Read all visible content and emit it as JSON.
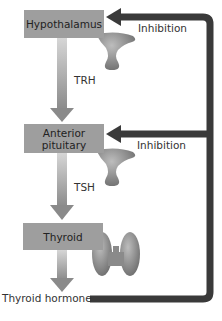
{
  "diagram": {
    "nodes": [
      {
        "id": "hypothalamus",
        "label": "Hypothalamus"
      },
      {
        "id": "anterior-pituitary",
        "label_line1": "Anterior",
        "label_line2": "pituitary"
      },
      {
        "id": "thyroid",
        "label": "Thyroid"
      }
    ],
    "edges": [
      {
        "from": "hypothalamus",
        "to": "anterior-pituitary",
        "label": "TRH"
      },
      {
        "from": "anterior-pituitary",
        "to": "thyroid",
        "label": "TSH"
      },
      {
        "from": "thyroid",
        "to": "output",
        "label": "Thyroid hormone"
      }
    ],
    "feedback": [
      {
        "from": "thyroid-hormone",
        "to": "hypothalamus",
        "label": "Inhibition"
      },
      {
        "from": "thyroid-hormone",
        "to": "anterior-pituitary",
        "label": "Inhibition"
      }
    ],
    "output_label": "Thyroid hormone",
    "colors": {
      "box": "#9e9e9e",
      "stimulation_arrow_top": "#c8c8c8",
      "stimulation_arrow_bottom": "#8a8a8a",
      "feedback_arrow": "#3a3a3a",
      "gland": "#8e8e8e"
    }
  }
}
